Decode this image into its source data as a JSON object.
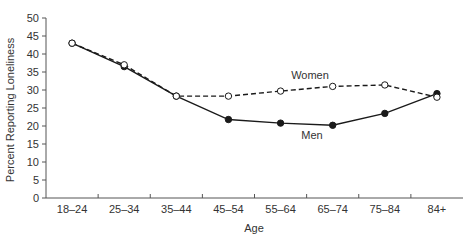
{
  "chart_data": {
    "type": "line",
    "title": "",
    "xlabel": "Age",
    "ylabel": "Percent Reporting Loneliness",
    "categories": [
      "18–24",
      "25–34",
      "35–44",
      "45–54",
      "55–64",
      "65–74",
      "75–84",
      "84+"
    ],
    "series": [
      {
        "name": "Women",
        "style": "dashed",
        "marker": "open-circle",
        "values": [
          43,
          37,
          28.3,
          28.3,
          29.7,
          31,
          31.4,
          28
        ]
      },
      {
        "name": "Men",
        "style": "solid",
        "marker": "filled-circle",
        "values": [
          43,
          36.5,
          28.3,
          21.8,
          20.8,
          20.2,
          23.5,
          29
        ]
      }
    ],
    "yticks": [
      0,
      5,
      10,
      15,
      20,
      25,
      30,
      35,
      40,
      45,
      50
    ],
    "ylim": [
      0,
      50
    ],
    "grid": false,
    "legend": "inline labels",
    "annotations": [
      {
        "text": "Women",
        "near": "65–74"
      },
      {
        "text": "Men",
        "near": "65–74"
      }
    ],
    "colors": {
      "line": "#1a1a1a",
      "axis": "#555555",
      "text": "#333333"
    }
  }
}
